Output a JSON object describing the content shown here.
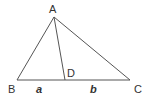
{
  "diagram": {
    "stroke_color": "#555555",
    "points": {
      "A": {
        "label": "A",
        "x": 54,
        "y": 17
      },
      "B": {
        "label": "B",
        "x": 17,
        "y": 80
      },
      "C": {
        "label": "C",
        "x": 130,
        "y": 80
      },
      "D": {
        "label": "D",
        "x": 65,
        "y": 80
      }
    },
    "segment_labels": {
      "BD": "a",
      "DC": "b"
    }
  }
}
